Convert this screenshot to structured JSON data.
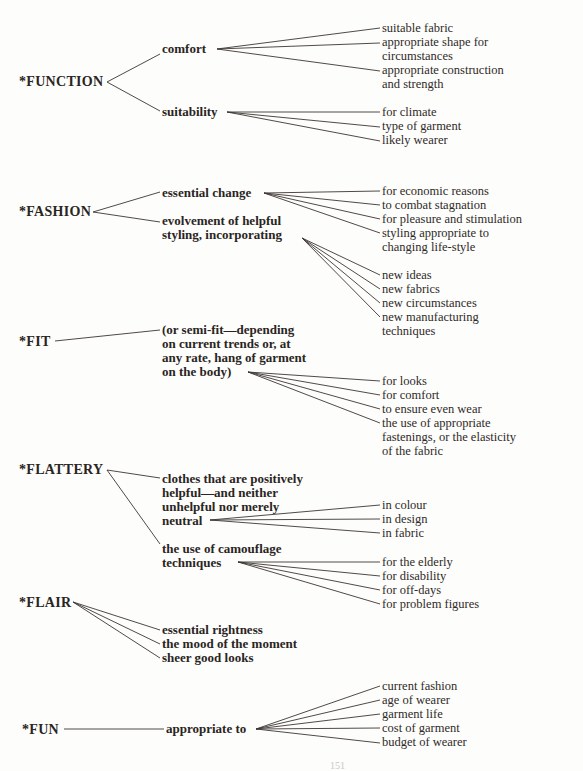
{
  "diagram": {
    "branches": [
      {
        "root": "*FUNCTION",
        "children": [
          {
            "label": "comfort",
            "leaves": [
              "suitable fabric",
              "appropriate shape for circumstances",
              "appropriate construction and strength"
            ]
          },
          {
            "label": "suitability",
            "leaves": [
              "for climate",
              "type of garment",
              "likely wearer"
            ]
          }
        ]
      },
      {
        "root": "*FASHION",
        "children": [
          {
            "label": "essential change",
            "leaves": [
              "for economic reasons",
              "to combat stagnation",
              "for pleasure and stimulation",
              "styling appropriate to changing life-style"
            ]
          },
          {
            "label": "evolvement of helpful styling, incorporating",
            "leaves": [
              "new ideas",
              "new fabrics",
              "new circumstances",
              "new manufacturing techniques"
            ]
          }
        ]
      },
      {
        "root": "*FIT",
        "children": [
          {
            "label": "(or semi-fit—depending on current trends or, at any rate, hang of garment on the body)",
            "leaves": [
              "for looks",
              "for comfort",
              "to ensure even wear",
              "the use of appropriate fastenings, or the elasticity of the fabric"
            ]
          }
        ]
      },
      {
        "root": "*FLATTERY",
        "children": [
          {
            "label": "clothes that are positively helpful—and neither unhelpful nor merely neutral",
            "leaves": [
              "in colour",
              "in design",
              "in fabric"
            ]
          },
          {
            "label": "the use of camouflage techniques",
            "leaves": [
              "for the elderly",
              "for disability",
              "for off-days",
              "for problem figures"
            ]
          }
        ]
      },
      {
        "root": "*FLAIR",
        "children": [
          {
            "label": "essential rightness",
            "leaves": []
          },
          {
            "label": "the mood of the moment",
            "leaves": []
          },
          {
            "label": "sheer good looks",
            "leaves": []
          }
        ]
      },
      {
        "root": "*FUN",
        "children": [
          {
            "label": "appropriate to",
            "leaves": [
              "current fashion",
              "age of wearer",
              "garment life",
              "cost of garment",
              "budget of wearer"
            ]
          }
        ]
      }
    ]
  },
  "text": {
    "function": "*FUNCTION",
    "comfort": "comfort",
    "suitable_fabric": "suitable fabric",
    "shape_1": "appropriate shape for",
    "shape_2": "circumstances",
    "construction_1": "appropriate construction",
    "construction_2": "and strength",
    "suitability": "suitability",
    "for_climate": "for climate",
    "type_of_garment": "type of garment",
    "likely_wearer": "likely wearer",
    "fashion": "*FASHION",
    "essential_change": "essential change",
    "evolvement_1": "evolvement of helpful",
    "evolvement_2": "styling, incorporating",
    "economic": "for economic reasons",
    "stagnation": "to combat stagnation",
    "pleasure": "for pleasure and stimulation",
    "styling_1": "styling appropriate to",
    "styling_2": "changing life-style",
    "new_ideas": "new ideas",
    "new_fabrics": "new fabrics",
    "new_circumstances": "new circumstances",
    "new_manufacturing_1": "new manufacturing",
    "new_manufacturing_2": "techniques",
    "fit": "*FIT",
    "fit_1": "(or semi-fit—depending",
    "fit_2": "on current trends or, at",
    "fit_3": "any rate, hang of garment",
    "fit_4": "on the body)",
    "for_looks": "for looks",
    "for_comfort": "for comfort",
    "even_wear": "to ensure even wear",
    "fastenings_1": "the use of appropriate",
    "fastenings_2": "fastenings, or the elasticity",
    "fastenings_3": "of the fabric",
    "flattery": "*FLATTERY",
    "clothes_1": "clothes that are positively",
    "clothes_2": "helpful—and neither",
    "clothes_3": "unhelpful nor merely",
    "clothes_4": "neutral",
    "in_colour": "in colour",
    "in_design": "in design",
    "in_fabric": "in fabric",
    "camouflage_1": "the use of camouflage",
    "camouflage_2": "techniques",
    "elderly": "for the elderly",
    "disability": "for disability",
    "off_days": "for off-days",
    "problem_figures": "for problem figures",
    "flair": "*FLAIR",
    "rightness": "essential rightness",
    "mood": "the mood of the moment",
    "good_looks": "sheer good looks",
    "fun": "*FUN",
    "appropriate_to": "appropriate to",
    "current_fashion": "current fashion",
    "age_of_wearer": "age of wearer",
    "garment_life": "garment life",
    "cost_of_garment": "cost of garment",
    "budget_of_wearer": "budget of wearer",
    "page_number": "151"
  }
}
